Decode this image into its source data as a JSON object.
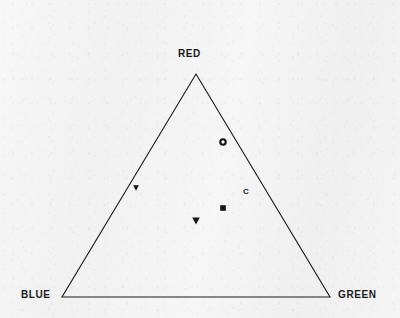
{
  "figure": {
    "background_color": "#f3f3f3",
    "line_color": "#1a1a1a",
    "marker_color": "#141414"
  },
  "corners": {
    "top": "RED",
    "bottom_left": "BLUE",
    "bottom_right": "GREEN"
  },
  "chart_data": {
    "type": "scatter",
    "title": "",
    "subtitle": "",
    "xlabel": "",
    "ylabel": "",
    "plot_shape": "ternary-triangle",
    "axes": [
      "RED",
      "BLUE",
      "GREEN"
    ],
    "axis_labels": {
      "apex": "RED",
      "left": "BLUE",
      "right": "GREEN"
    },
    "grid": false,
    "legend": "none",
    "triangle_vertices_px": {
      "apex": [
        196,
        74
      ],
      "bottom_left": [
        62,
        297
      ],
      "bottom_right": [
        330,
        297
      ]
    },
    "points": [
      {
        "label": "D",
        "marker": "circle-open",
        "px": [
          223,
          142
        ],
        "ternary": {
          "red": 0.7,
          "blue": 0.1,
          "green": 0.2
        }
      },
      {
        "label": "C",
        "marker": "text",
        "px": [
          246,
          192
        ],
        "ternary": {
          "red": 0.47,
          "blue": 0.11,
          "green": 0.42
        }
      },
      {
        "label": "B",
        "marker": "square-filled",
        "px": [
          223,
          208
        ],
        "ternary": {
          "red": 0.4,
          "blue": 0.25,
          "green": 0.35
        }
      },
      {
        "label": "A",
        "marker": "triangle-down-filled",
        "px": [
          196,
          221
        ],
        "ternary": {
          "red": 0.34,
          "blue": 0.33,
          "green": 0.33
        }
      },
      {
        "label": "E",
        "marker": "triangle-down-filled",
        "px": [
          136,
          188
        ],
        "ternary": {
          "red": 0.49,
          "blue": 0.49,
          "green": 0.02
        }
      }
    ]
  }
}
